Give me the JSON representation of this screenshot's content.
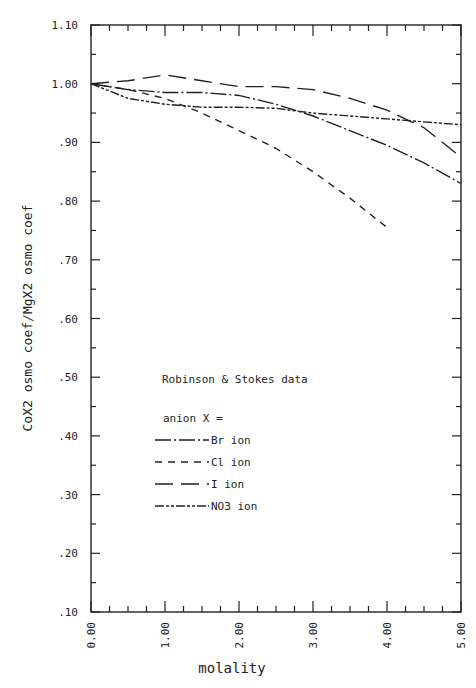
{
  "chart_data": {
    "type": "line",
    "title": "",
    "xlabel": "molality",
    "ylabel": "CoX2 osmo coef/MgX2 osmo coef",
    "xlim": [
      0,
      5
    ],
    "ylim": [
      0.1,
      1.1
    ],
    "x_ticks": [
      "0.00",
      "1.00",
      "2.00",
      "3.00",
      "4.00",
      "5.00"
    ],
    "y_ticks": [
      "1.10",
      "1.00",
      ".90",
      ".80",
      ".70",
      ".60",
      ".50",
      ".40",
      ".30",
      ".20",
      ".10"
    ],
    "grid": false,
    "annotation": "Robinson & Stokes data",
    "legend_title": "anion X =",
    "legend_position": "inside-left-middle",
    "series": [
      {
        "name": "Br ion",
        "style": "dash-dot",
        "x": [
          0,
          0.5,
          1.0,
          1.5,
          2.0,
          2.5,
          3.0,
          3.5,
          4.0,
          4.5,
          5.0
        ],
        "values": [
          1.0,
          0.99,
          0.985,
          0.985,
          0.98,
          0.965,
          0.945,
          0.92,
          0.895,
          0.865,
          0.83
        ]
      },
      {
        "name": "Cl ion",
        "style": "short-dash",
        "x": [
          0,
          0.5,
          1.0,
          1.5,
          2.0,
          2.5,
          3.0,
          3.5,
          4.0
        ],
        "values": [
          1.0,
          0.99,
          0.975,
          0.95,
          0.92,
          0.89,
          0.85,
          0.805,
          0.755
        ]
      },
      {
        "name": "I ion",
        "style": "long-dash",
        "x": [
          0,
          0.5,
          1.0,
          1.5,
          2.0,
          2.5,
          3.0,
          3.5,
          4.0,
          4.5,
          5.0
        ],
        "values": [
          1.0,
          1.005,
          1.015,
          1.005,
          0.995,
          0.995,
          0.99,
          0.975,
          0.955,
          0.925,
          0.875
        ]
      },
      {
        "name": "NO3 ion",
        "style": "dash-dot-dot",
        "x": [
          0,
          0.5,
          1.0,
          1.5,
          2.0,
          2.5,
          3.0,
          3.5,
          4.0,
          4.5,
          5.0
        ],
        "values": [
          1.0,
          0.975,
          0.965,
          0.96,
          0.96,
          0.958,
          0.95,
          0.945,
          0.94,
          0.935,
          0.93
        ]
      }
    ]
  },
  "legend": {
    "title": "anion X =",
    "items": [
      {
        "label": "Br ion"
      },
      {
        "label": "Cl ion"
      },
      {
        "label": "I ion"
      },
      {
        "label": "NO3 ion"
      }
    ]
  }
}
